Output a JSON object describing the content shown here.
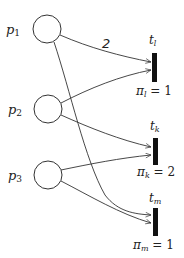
{
  "diagram": {
    "type": "petri-net",
    "places": [
      {
        "id": "p1",
        "label_main": "p",
        "label_sub": "1",
        "cx": 47,
        "cy": 29,
        "r": 14
      },
      {
        "id": "p2",
        "label_main": "p",
        "label_sub": "2",
        "cx": 48,
        "cy": 109,
        "r": 14
      },
      {
        "id": "p3",
        "label_main": "p",
        "label_sub": "3",
        "cx": 48,
        "cy": 175,
        "r": 14
      }
    ],
    "transitions": [
      {
        "id": "t_l",
        "label_main": "t",
        "label_sub": "l",
        "priority_symbol": "π",
        "priority_sub": "l",
        "priority_text": " = 1",
        "priority": 1
      },
      {
        "id": "t_k",
        "label_main": "t",
        "label_sub": "k",
        "priority_symbol": "π",
        "priority_sub": "k",
        "priority_text": " = 2",
        "priority": 2
      },
      {
        "id": "t_m",
        "label_main": "t",
        "label_sub": "m",
        "priority_symbol": "π",
        "priority_sub": "m",
        "priority_text": " = 1",
        "priority": 1
      }
    ],
    "arcs": [
      {
        "from": "p1",
        "to": "t_l",
        "weight": "2"
      },
      {
        "from": "p2",
        "to": "t_l",
        "weight": ""
      },
      {
        "from": "p2",
        "to": "t_k",
        "weight": ""
      },
      {
        "from": "p3",
        "to": "t_k",
        "weight": ""
      },
      {
        "from": "p1",
        "to": "t_m",
        "weight": ""
      },
      {
        "from": "p3",
        "to": "t_m",
        "weight": ""
      }
    ],
    "colors": {
      "stroke": "#333333",
      "transition_fill": "#111111",
      "background": "#ffffff"
    }
  }
}
